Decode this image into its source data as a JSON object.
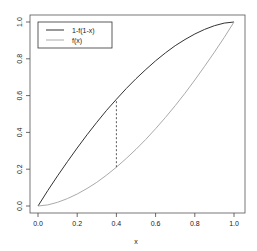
{
  "chart_data": {
    "type": "line",
    "title": "",
    "xlabel": "x",
    "ylabel": "",
    "xlim": [
      0,
      1
    ],
    "ylim": [
      0,
      1
    ],
    "grid": false,
    "legend_position": "top-left",
    "x_ticks": [
      "0.0",
      "0.2",
      "0.4",
      "0.6",
      "0.8",
      "1.0"
    ],
    "y_ticks": [
      "0.0",
      "0.2",
      "0.4",
      "0.6",
      "0.8",
      "1.0"
    ],
    "x": [
      0.0,
      0.05,
      0.1,
      0.15,
      0.2,
      0.25,
      0.3,
      0.35,
      0.4,
      0.45,
      0.5,
      0.55,
      0.6,
      0.65,
      0.7,
      0.75,
      0.8,
      0.85,
      0.9,
      0.95,
      1.0
    ],
    "series": [
      {
        "name": "1-f(1-x)",
        "color": "#333333",
        "values": [
          0.0,
          0.084,
          0.164,
          0.241,
          0.315,
          0.387,
          0.455,
          0.52,
          0.58,
          0.638,
          0.692,
          0.742,
          0.789,
          0.832,
          0.871,
          0.905,
          0.935,
          0.96,
          0.98,
          0.994,
          1.0
        ]
      },
      {
        "name": "f(x)",
        "color": "#aaaaaa",
        "values": [
          0.0,
          0.006,
          0.02,
          0.04,
          0.065,
          0.095,
          0.129,
          0.168,
          0.211,
          0.258,
          0.308,
          0.362,
          0.42,
          0.481,
          0.545,
          0.613,
          0.685,
          0.759,
          0.836,
          0.916,
          1.0
        ]
      }
    ],
    "annotations": [
      {
        "type": "dashed-vertical-segment",
        "x": 0.4,
        "y_from": 0.211,
        "y_to": 0.58
      }
    ]
  }
}
